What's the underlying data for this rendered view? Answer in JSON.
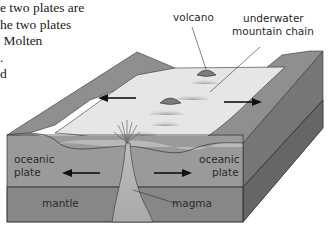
{
  "text_fragment": {
    "lines": [
      "e two plates are",
      "he two plates",
      " Molten",
      ".",
      "d"
    ]
  },
  "diagram": {
    "labels": {
      "volcano": "volcano",
      "mountain_chain_1": "underwater",
      "mountain_chain_2": "mountain chain",
      "left_plate_1": "oceanic",
      "left_plate_2": "plate",
      "right_plate_1": "oceanic",
      "right_plate_2": "plate",
      "mantle": "mantle",
      "magma": "magma"
    },
    "colors": {
      "seafloor": "#e6e6e6",
      "plate_top": "#8f8f8f",
      "plate_front": "#9c9c9c",
      "mantle_front": "#858585",
      "side_face": "#7a7a7a",
      "side_face_dark": "#6a6a6a",
      "ink": "#1a1a1a"
    }
  }
}
